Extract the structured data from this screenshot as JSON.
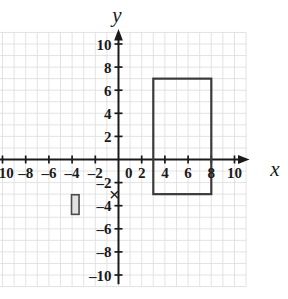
{
  "chart_data": {
    "type": "scatter",
    "title": "",
    "xlabel": "x",
    "ylabel": "y",
    "grid": true,
    "grid_step": 1,
    "legend": "none",
    "xlim": [
      -11,
      11
    ],
    "ylim": [
      -11,
      11
    ],
    "x_ticks": [
      -10,
      -8,
      -6,
      -4,
      -2,
      0,
      2,
      4,
      6,
      8,
      10
    ],
    "y_ticks": [
      -10,
      -8,
      -6,
      -4,
      -2,
      2,
      4,
      6,
      8,
      10
    ],
    "x_tick_labels": [
      "–10",
      "–8",
      "–6",
      "–4",
      "–2",
      "0",
      "2",
      "4",
      "6",
      "8",
      "10"
    ],
    "y_tick_labels": [
      "–10",
      "–8",
      "–6",
      "–4",
      "–2",
      "2",
      "4",
      "6",
      "8",
      "10"
    ],
    "origin_label": "0",
    "shapes": [
      {
        "name": "large-rectangle",
        "type": "rectangle",
        "x_min": 3,
        "x_max": 8,
        "y_min": -3,
        "y_max": 7,
        "width": 5,
        "height": 10,
        "stroke": "#3a3a3a",
        "fill": "none",
        "stroke_width": 2.2
      },
      {
        "name": "small-rectangle",
        "type": "rectangle",
        "x_min": -4.05,
        "x_max": -3.4,
        "y_min": -4.75,
        "y_max": -3.05,
        "width": 0.65,
        "height": 1.7,
        "stroke": "#4a4a4a",
        "fill": "#e2e2e2",
        "stroke_width": 1.6
      }
    ],
    "annotations": [
      {
        "name": "x-mark",
        "text": "×",
        "x": -0.35,
        "y": -3.05
      }
    ]
  },
  "axes": {
    "x_axis_label": "x",
    "y_axis_label": "y",
    "x_arrow": "right",
    "y_arrow": "up",
    "axis_color": "#1a1a1a",
    "grid_color": "#dcdcdc"
  },
  "colors": {
    "background": "#ffffff",
    "axis": "#1a1a1a",
    "grid": "#dcdcdc",
    "shape_stroke": "#3a3a3a",
    "shape_fill": "#e2e2e2"
  }
}
